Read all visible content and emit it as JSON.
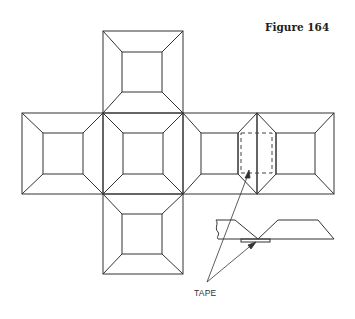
{
  "figure": {
    "title": "Figure 164",
    "label": "TAPE",
    "line_color": "#333333",
    "dash_color": "#444444",
    "faces": [
      {
        "name": "top",
        "x": 103,
        "y": 31,
        "size": 80
      },
      {
        "name": "left",
        "x": 22,
        "y": 113,
        "size": 81
      },
      {
        "name": "center",
        "x": 103,
        "y": 113,
        "size": 80
      },
      {
        "name": "right-1",
        "x": 183,
        "y": 113,
        "size": 74
      },
      {
        "name": "right-2",
        "x": 257,
        "y": 113,
        "size": 77
      },
      {
        "name": "bottom",
        "x": 103,
        "y": 194,
        "size": 80
      }
    ]
  }
}
